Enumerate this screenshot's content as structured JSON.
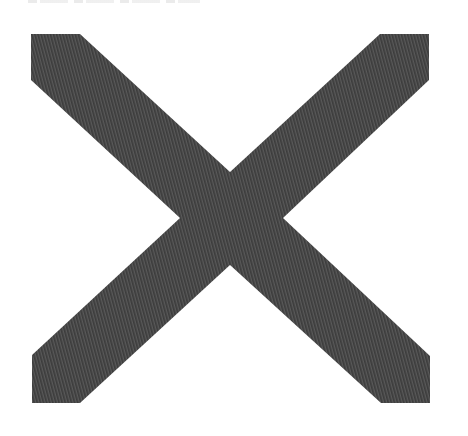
{
  "image": {
    "subject": "Large X mark",
    "description": "A large dark gray X (cross / multiplication sign) shape with a fine diagonal woven twill fabric texture on a white background.",
    "colors": {
      "background": "#ffffff",
      "x_fill_dark": "#3e3e3e",
      "x_fill_light": "#5a5a5a",
      "x_fill_base": "#4a4a4a"
    },
    "x_shape": {
      "icon": "close-x",
      "corners": {
        "top_left_arm": [
          [
            31,
            34
          ],
          [
            80,
            34
          ]
        ],
        "top_right_arm": [
          [
            380,
            34
          ],
          [
            429,
            34
          ]
        ],
        "bottom_left_arm": [
          [
            32,
            403
          ],
          [
            80,
            403
          ]
        ],
        "bottom_right_arm": [
          [
            381,
            403
          ],
          [
            430,
            403
          ]
        ]
      },
      "center_notches": {
        "top": [
          230,
          172
        ],
        "bottom": [
          230,
          265
        ],
        "left": [
          180,
          218
        ],
        "right": [
          283,
          218
        ]
      }
    }
  }
}
